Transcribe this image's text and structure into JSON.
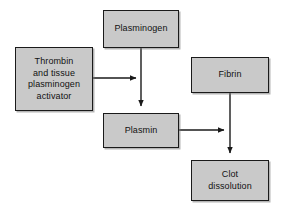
{
  "diagram": {
    "type": "flowchart",
    "background_color": "#ffffff",
    "node_fill_color": "#c9c9c9",
    "node_border_color": "#1a1a1a",
    "arrow_color": "#1a1a1a",
    "nodes": [
      {
        "id": "plasminogen",
        "label": "Plasminogen"
      },
      {
        "id": "activator",
        "label": "Thrombin\nand tissue\nplasminogen\nactivator"
      },
      {
        "id": "plasmin",
        "label": "Plasmin"
      },
      {
        "id": "fibrin",
        "label": "Fibrin"
      },
      {
        "id": "clot",
        "label": "Clot\ndissolution"
      }
    ],
    "edges": [
      {
        "id": "plasminogen-to-plasmin",
        "from": "plasminogen",
        "to": "plasmin",
        "direction": "down",
        "label": ""
      },
      {
        "id": "activator-to-junction",
        "from": "activator",
        "to": "plasminogen-to-plasmin",
        "direction": "right",
        "label": ""
      },
      {
        "id": "plasmin-to-fibrin-line",
        "from": "plasmin",
        "to": "fibrin-to-clot",
        "direction": "right",
        "label": ""
      },
      {
        "id": "fibrin-to-clot",
        "from": "fibrin",
        "to": "clot",
        "direction": "down",
        "label": ""
      }
    ]
  }
}
